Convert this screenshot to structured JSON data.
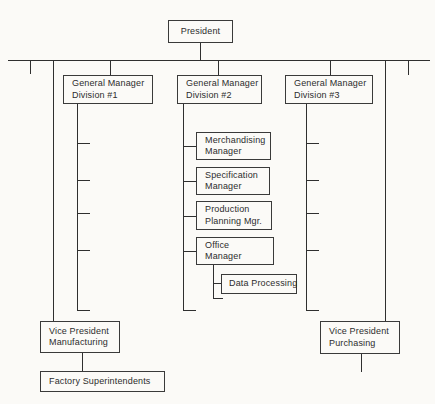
{
  "nodes": {
    "president": {
      "label": "President"
    },
    "gm1": {
      "line1": "General Manager",
      "line2": "Division #1"
    },
    "gm2": {
      "line1": "General Manager",
      "line2": "Division #2"
    },
    "gm3": {
      "line1": "General Manager",
      "line2": "Division #3"
    },
    "merchandising": {
      "line1": "Merchandising",
      "line2": "Manager"
    },
    "specification": {
      "line1": "Specification",
      "line2": "Manager"
    },
    "production": {
      "line1": "Production",
      "line2": "Planning Mgr."
    },
    "office": {
      "line1": "Office",
      "line2": "Manager"
    },
    "data_processing": {
      "label": "Data Processing"
    },
    "vp_manufacturing": {
      "line1": "Vice President",
      "line2": "Manufacturing"
    },
    "vp_purchasing": {
      "line1": "Vice President",
      "line2": "Purchasing"
    },
    "factory": {
      "label": "Factory Superintendents"
    }
  },
  "hierarchy": {
    "President": [
      "General Manager Division #1",
      "General Manager Division #2",
      "General Manager Division #3",
      "Vice President Manufacturing",
      "Vice President Purchasing"
    ],
    "General Manager Division #2": [
      "Merchandising Manager",
      "Specification Manager",
      "Production Planning Mgr.",
      "Office Manager"
    ],
    "Office Manager": [
      "Data Processing"
    ],
    "Vice President Manufacturing": [
      "Factory Superintendents"
    ]
  },
  "unlabeled_marks": {
    "division1_spine_ticks": 5,
    "division3_spine_ticks": 5,
    "division2_spine_end_tick": 1,
    "office_spine_end_tick": 1,
    "trunk_left_stub": 1,
    "trunk_right_stub": 1,
    "vp_purchasing_bottom_stub": 1
  },
  "colors": {
    "background": "#fbfaf7",
    "line": "#2f2f2f",
    "text": "#2d2d2d"
  }
}
